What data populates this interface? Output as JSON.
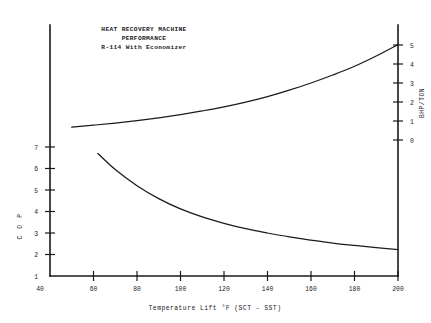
{
  "chart_data": {
    "type": "line",
    "title": "HEAT RECOVERY MACHINE PERFORMANCE R-114 With Economizer",
    "title_lines": [
      "HEAT RECOVERY MACHINE",
      "PERFORMANCE",
      "R-114 With Economizer"
    ],
    "xlabel": "Temperature Lift °F (SCT - SST)",
    "ylabel": "C O P",
    "y2label": "BHP/TON",
    "xlim": [
      40,
      200
    ],
    "ylim": [
      1,
      7
    ],
    "y2lim": [
      0,
      5
    ],
    "grid": false,
    "legend": null,
    "xticks": [
      40,
      60,
      80,
      100,
      120,
      140,
      160,
      180,
      200
    ],
    "xtick_labels": [
      "40",
      "60",
      "80",
      "100",
      "120",
      "140",
      "160",
      "180",
      "200"
    ],
    "yticks": [
      1,
      2,
      3,
      4,
      5,
      6,
      7
    ],
    "ytick_labels": [
      "1",
      "2",
      "3",
      "4",
      "5",
      "6",
      "7"
    ],
    "y2ticks": [
      0,
      1,
      2,
      3,
      4,
      5
    ],
    "y2tick_labels": [
      "0",
      "1",
      "2",
      "3",
      "4",
      "5"
    ],
    "series": [
      {
        "name": "BHP/TON",
        "axis": "right",
        "x": [
          50,
          60,
          70,
          80,
          90,
          100,
          110,
          120,
          130,
          140,
          150,
          160,
          170,
          180,
          190,
          200
        ],
        "values": [
          0.68,
          0.78,
          0.89,
          1.02,
          1.17,
          1.34,
          1.53,
          1.74,
          1.99,
          2.28,
          2.62,
          3.0,
          3.42,
          3.88,
          4.42,
          5.02
        ]
      },
      {
        "name": "C O P",
        "axis": "left",
        "x": [
          62,
          70,
          80,
          90,
          100,
          110,
          120,
          130,
          140,
          150,
          160,
          170,
          180,
          190,
          200
        ],
        "values": [
          6.7,
          5.95,
          5.2,
          4.6,
          4.12,
          3.75,
          3.45,
          3.2,
          3.0,
          2.82,
          2.67,
          2.53,
          2.42,
          2.32,
          2.23
        ]
      }
    ]
  },
  "figure": {
    "background_color": "#ffffff",
    "ink_color": "#1a1a1a"
  }
}
